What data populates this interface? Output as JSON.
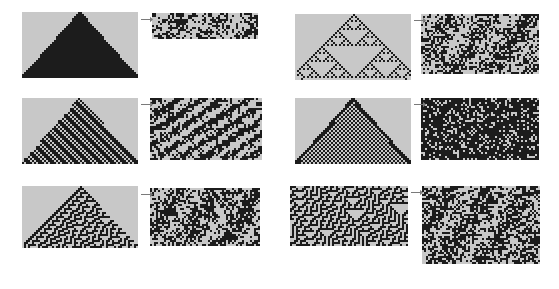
{
  "figure": {
    "background_color": "#ffffff",
    "grid_line_color": "#b4b4b4",
    "cell_on_color": "#1c1c1c",
    "cell_off_color": "#c8c8c8",
    "arrow_color": "#7a7a7a",
    "arrow_glyph": "right-arrow",
    "arrow_label": "→",
    "columns": 2,
    "rows": 3
  },
  "pairs": [
    {
      "id": "pair-1",
      "column": 0,
      "row": 0,
      "arrow_label": "→",
      "left": {
        "name": "growth-panel-1",
        "label": "",
        "x": 22,
        "y": 12,
        "w": 116,
        "h": 66,
        "cols": 58,
        "rows": 33,
        "pattern": "solid-triangle",
        "rule": 255,
        "density": 1.0,
        "grid": true,
        "seed": 11
      },
      "right": {
        "name": "steady-state-panel-1",
        "label": "",
        "x": 152,
        "y": 13,
        "w": 106,
        "h": 26,
        "cols": 53,
        "rows": 13,
        "pattern": "noise",
        "density": 0.42,
        "grid": true,
        "seed": 21
      }
    },
    {
      "id": "pair-2",
      "column": 0,
      "row": 1,
      "arrow_label": "→",
      "left": {
        "name": "growth-panel-2",
        "label": "",
        "x": 22,
        "y": 98,
        "w": 116,
        "h": 66,
        "cols": 58,
        "rows": 33,
        "pattern": "lattice-triangle",
        "rule": 150,
        "density": 0.6,
        "grid": true,
        "seed": 12
      },
      "right": {
        "name": "steady-state-panel-2",
        "label": "",
        "x": 150,
        "y": 98,
        "w": 112,
        "h": 62,
        "cols": 56,
        "rows": 31,
        "pattern": "diagonal-noise",
        "density": 0.5,
        "grid": true,
        "seed": 22
      }
    },
    {
      "id": "pair-3",
      "column": 0,
      "row": 2,
      "arrow_label": "→",
      "left": {
        "name": "growth-panel-3",
        "label": "",
        "x": 22,
        "y": 186,
        "w": 116,
        "h": 62,
        "cols": 58,
        "rows": 31,
        "pattern": "maze-triangle",
        "rule": 30,
        "density": 0.45,
        "grid": true,
        "seed": 13
      },
      "right": {
        "name": "steady-state-panel-3",
        "label": "",
        "x": 150,
        "y": 188,
        "w": 110,
        "h": 58,
        "cols": 55,
        "rows": 29,
        "pattern": "noise",
        "density": 0.5,
        "grid": true,
        "seed": 23
      }
    },
    {
      "id": "pair-4",
      "column": 1,
      "row": 0,
      "arrow_label": "→",
      "left": {
        "name": "growth-panel-4",
        "label": "",
        "x": 295,
        "y": 14,
        "w": 116,
        "h": 66,
        "cols": 58,
        "rows": 33,
        "pattern": "sierpinski",
        "rule": 90,
        "density": 0.33,
        "grid": true,
        "seed": 14
      },
      "right": {
        "name": "steady-state-panel-4",
        "label": "",
        "x": 421,
        "y": 14,
        "w": 118,
        "h": 60,
        "cols": 59,
        "rows": 30,
        "pattern": "noise",
        "density": 0.48,
        "grid": true,
        "seed": 24
      }
    },
    {
      "id": "pair-5",
      "column": 1,
      "row": 1,
      "arrow_label": "→",
      "left": {
        "name": "growth-panel-5",
        "label": "",
        "x": 295,
        "y": 98,
        "w": 116,
        "h": 66,
        "cols": 58,
        "rows": 33,
        "pattern": "checker-triangle",
        "rule": 250,
        "density": 0.5,
        "grid": true,
        "seed": 15
      },
      "right": {
        "name": "steady-state-panel-5",
        "label": "",
        "x": 421,
        "y": 98,
        "w": 118,
        "h": 62,
        "cols": 59,
        "rows": 31,
        "pattern": "dense-noise",
        "density": 0.72,
        "grid": true,
        "seed": 25
      }
    },
    {
      "id": "pair-6",
      "column": 1,
      "row": 2,
      "arrow_label": "→",
      "left": {
        "name": "growth-panel-6",
        "label": "",
        "x": 290,
        "y": 186,
        "w": 118,
        "h": 60,
        "cols": 59,
        "rows": 30,
        "pattern": "maze-full",
        "rule": 30,
        "density": 0.45,
        "grid": true,
        "seed": 16
      },
      "right": {
        "name": "steady-state-panel-6",
        "label": "",
        "x": 422,
        "y": 186,
        "w": 118,
        "h": 78,
        "cols": 59,
        "rows": 39,
        "pattern": "noise",
        "density": 0.52,
        "grid": true,
        "seed": 26
      }
    }
  ]
}
